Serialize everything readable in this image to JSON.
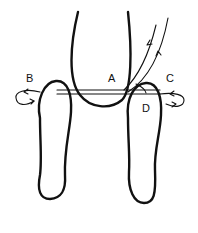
{
  "diagram": {
    "labels": {
      "a": "A",
      "b": "B",
      "c": "C",
      "d": "D"
    },
    "colors": {
      "ink": "#111111",
      "background": "#ffffff"
    },
    "shapes": {
      "center": "u-shaped loop",
      "left_leg": "left elongated loop",
      "right_leg": "right elongated loop",
      "bar": "horizontal double-line bar",
      "flow_lines": "two curved lines with arrows rising to upper right",
      "left_loop": "curled arrow loop at left (B)",
      "right_loop": "curled arrow loop at right (C)"
    }
  }
}
